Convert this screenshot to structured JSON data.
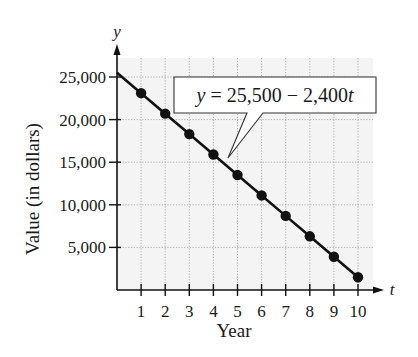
{
  "chart_data": {
    "type": "line",
    "title": "",
    "xlabel": "Year",
    "ylabel": "Value (in dollars)",
    "x_axis_variable": "t",
    "y_axis_variable": "y",
    "x": [
      1,
      2,
      3,
      4,
      5,
      6,
      7,
      8,
      9,
      10
    ],
    "series": [
      {
        "name": "y = 25,500 − 2,400t",
        "values": [
          23100,
          20700,
          18300,
          15900,
          13500,
          11100,
          8700,
          6300,
          3900,
          1500
        ],
        "line_start": {
          "t": 0,
          "y": 25500
        },
        "markers": true
      }
    ],
    "xticks": [
      "1",
      "2",
      "3",
      "4",
      "5",
      "6",
      "7",
      "8",
      "9",
      "10"
    ],
    "yticks": [
      "5,000",
      "10,000",
      "15,000",
      "20,000",
      "25,000"
    ],
    "ytick_values": [
      5000,
      10000,
      15000,
      20000,
      25000
    ],
    "xlim": [
      0,
      10
    ],
    "ylim": [
      0,
      27500
    ],
    "grid": true,
    "legend": null,
    "annotations": [
      {
        "text_prefix": "y",
        "text_body": " = 25,500 − 2,400",
        "text_var": "t",
        "points_to": {
          "t": 4.6,
          "y": 14500
        }
      }
    ]
  },
  "colors": {
    "line": "#111111",
    "grid": "#9a9a9a",
    "plot_background": "#f4f4f4",
    "axis": "#111111"
  }
}
